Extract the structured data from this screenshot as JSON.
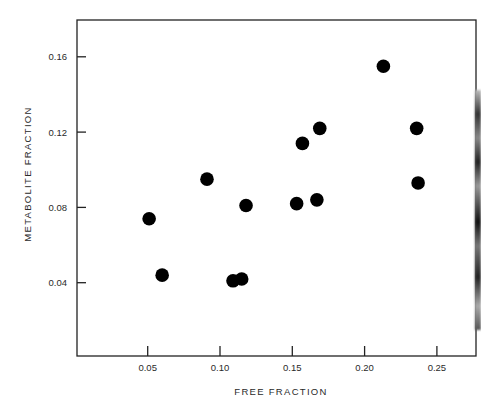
{
  "chart_data": {
    "type": "scatter",
    "title": "",
    "xlabel": "FREE FRACTION",
    "ylabel": "METABOLITE FRACTION",
    "xlim": [
      0,
      0.277
    ],
    "ylim": [
      0,
      0.18
    ],
    "xticks": [
      0.05,
      0.1,
      0.15,
      0.2,
      0.25
    ],
    "xtick_labels": [
      "0.05",
      "0.10",
      "0.15",
      "0.20",
      "0.25"
    ],
    "yticks": [
      0.04,
      0.08,
      0.12,
      0.16
    ],
    "ytick_labels": [
      "0.04",
      "0.08",
      "0.12",
      "0.16"
    ],
    "grid": false,
    "legend": null,
    "marker": "filled-circle",
    "marker_color": "#000000",
    "points": [
      {
        "x": 0.051,
        "y": 0.074
      },
      {
        "x": 0.06,
        "y": 0.044
      },
      {
        "x": 0.091,
        "y": 0.095
      },
      {
        "x": 0.118,
        "y": 0.081
      },
      {
        "x": 0.109,
        "y": 0.041
      },
      {
        "x": 0.115,
        "y": 0.042
      },
      {
        "x": 0.153,
        "y": 0.082
      },
      {
        "x": 0.157,
        "y": 0.114
      },
      {
        "x": 0.169,
        "y": 0.122
      },
      {
        "x": 0.167,
        "y": 0.084
      },
      {
        "x": 0.213,
        "y": 0.155
      },
      {
        "x": 0.236,
        "y": 0.122
      },
      {
        "x": 0.237,
        "y": 0.093
      }
    ]
  }
}
